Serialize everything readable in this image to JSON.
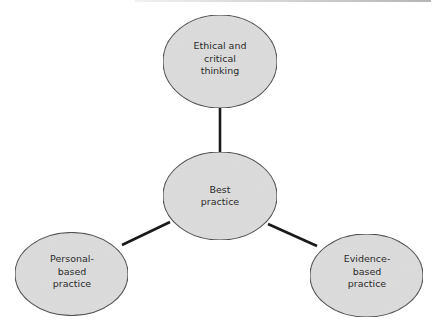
{
  "diagram": {
    "type": "hub-and-spoke concept diagram",
    "colors": {
      "node_fill": "#dcdcdc",
      "node_stroke": "#4a4a4a",
      "connector": "#1a1a1a",
      "text": "#2b2b2b",
      "background": "#ffffff"
    },
    "center_node": {
      "id": "best-practice",
      "label": "Best\npractice"
    },
    "nodes": [
      {
        "id": "ethical-critical-thinking",
        "label": "Ethical and\ncritical\nthinking",
        "position": "top"
      },
      {
        "id": "personal-based-practice",
        "label": "Personal-\nbased\npractice",
        "position": "bottom-left"
      },
      {
        "id": "evidence-based-practice",
        "label": "Evidence-\nbased\npractice",
        "position": "bottom-right"
      }
    ],
    "edges": [
      {
        "from": "best-practice",
        "to": "ethical-critical-thinking"
      },
      {
        "from": "best-practice",
        "to": "personal-based-practice"
      },
      {
        "from": "best-practice",
        "to": "evidence-based-practice"
      }
    ]
  }
}
